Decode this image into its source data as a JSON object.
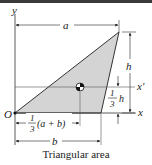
{
  "figure": {
    "caption": "Triangular area",
    "colors": {
      "fill": "#d4d4d4",
      "line": "#222222",
      "top_bar": "#3a3a3a"
    },
    "axes": {
      "y_label": "y",
      "x_label": "x",
      "x_prime_label": "x'",
      "origin_label": "O"
    },
    "dimensions": {
      "a": "a",
      "b": "b",
      "h": "h",
      "third_h_num": "1",
      "third_h_den": "3",
      "third_h_var": "h",
      "third_ab_num": "1",
      "third_ab_den": "3",
      "third_ab_expr": "(a + b)"
    },
    "centroid_symbol": "centroid"
  }
}
